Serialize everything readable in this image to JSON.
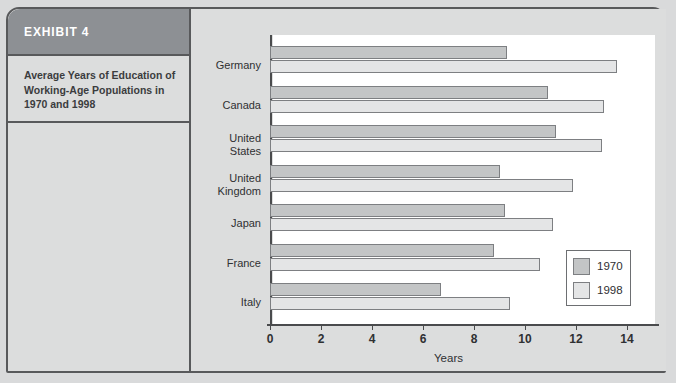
{
  "exhibit": {
    "header_label": "EXHIBIT 4",
    "caption": "Average Years of Education of Working-Age Populations in 1970 and 1998",
    "header_color": "#8d9094",
    "panel_color": "#dcdddd"
  },
  "legend": {
    "position": "inside-bottom-right",
    "entries": [
      {
        "label": "1970",
        "color": "#c3c5c6"
      },
      {
        "label": "1998",
        "color": "#e4e5e6"
      }
    ]
  },
  "chart_data": {
    "type": "bar",
    "orientation": "horizontal",
    "title": "Average Years of Education of Working-Age Populations in 1970 and 1998",
    "xlabel": "Years",
    "ylabel": "",
    "xlim": [
      0,
      14
    ],
    "xticks": [
      0,
      2,
      4,
      6,
      8,
      10,
      12,
      14
    ],
    "grid": false,
    "categories": [
      "Germany",
      "Canada",
      "United\nStates",
      "United\nKingdom",
      "Japan",
      "France",
      "Italy"
    ],
    "series": [
      {
        "name": "1970",
        "color": "#c3c5c6",
        "values": [
          9.3,
          10.9,
          11.2,
          9.0,
          9.2,
          8.8,
          6.7
        ]
      },
      {
        "name": "1998",
        "color": "#e4e5e6",
        "values": [
          13.6,
          13.1,
          13.0,
          11.9,
          11.1,
          10.6,
          9.4
        ]
      }
    ]
  }
}
